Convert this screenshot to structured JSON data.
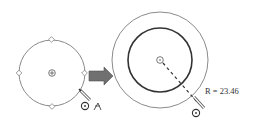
{
  "diagram": {
    "before": {
      "circle": {
        "cx": 52,
        "cy": 73,
        "r": 33,
        "stroke": "#8a8a8a"
      },
      "handles": [
        "top",
        "right",
        "bottom",
        "left"
      ],
      "center_marker": "center-point"
    },
    "arrow": {
      "color": "#6f6f6f",
      "direction": "right"
    },
    "after": {
      "outer_circle": {
        "cx": 160,
        "cy": 60,
        "r": 48,
        "stroke": "#8a8a8a"
      },
      "inner_circle": {
        "cx": 160,
        "cy": 60,
        "r": 32,
        "stroke": "#333333"
      },
      "radius_label": "R = 23.46"
    },
    "cursors": [
      "pencil-icon",
      "circle-cursor-icon",
      "snap-icon"
    ]
  }
}
